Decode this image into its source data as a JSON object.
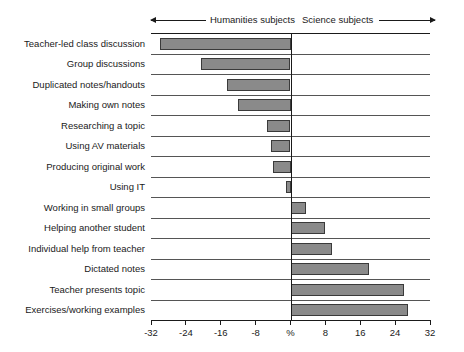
{
  "header": {
    "left_label": "Humanities subjects",
    "right_label": "Science subjects",
    "left_arrow_icon": "arrow-left-icon",
    "right_arrow_icon": "arrow-right-icon"
  },
  "chart_data": {
    "type": "bar",
    "orientation": "horizontal",
    "title": "",
    "subtitle": "",
    "xlabel": "%",
    "ylabel": "",
    "xlim": [
      -32,
      32
    ],
    "grid": true,
    "legend": null,
    "zero_reference": 0,
    "annotations": [
      "Humanities subjects",
      "Science subjects"
    ],
    "xticks": [
      -32,
      -24,
      -16,
      -8,
      0,
      8,
      16,
      24,
      32
    ],
    "xticklabels": [
      "-32",
      "-24",
      "-16",
      "-8",
      "%",
      "8",
      "16",
      "24",
      "32"
    ],
    "categories": [
      "Teacher-led class discussion",
      "Group discussions",
      "Duplicated notes/handouts",
      "Making own notes",
      "Researching a topic",
      "Using AV materials",
      "Producing original work",
      "Using IT",
      "Working in small groups",
      "Helping another student",
      "Individual help from teacher",
      "Dictated notes",
      "Teacher presents topic",
      "Exercises/working examples"
    ],
    "values": [
      -30,
      -20.5,
      -14.5,
      -12,
      -5.5,
      -4.5,
      -4,
      -1,
      3.5,
      8,
      9.5,
      18,
      26,
      27
    ]
  },
  "style": {
    "bar_fill": "#8a8a8a",
    "bar_border": "#3a3a3a",
    "axis_color": "#1a1a1a",
    "grid_color": "#555555",
    "background": "#ffffff"
  }
}
